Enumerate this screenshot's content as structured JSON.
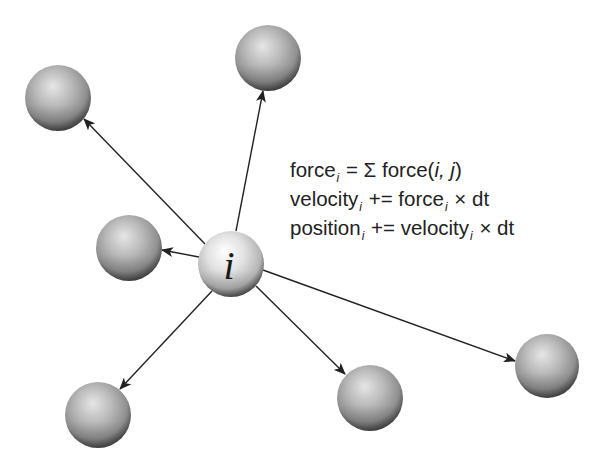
{
  "diagram": {
    "center_particle": {
      "label": "i",
      "cx": 231,
      "cy": 264,
      "r": 33
    },
    "neighbors": [
      {
        "name": "top-left",
        "cx": 58,
        "cy": 98,
        "r": 33
      },
      {
        "name": "top",
        "cx": 268,
        "cy": 58,
        "r": 33
      },
      {
        "name": "left",
        "cx": 129,
        "cy": 248,
        "r": 33
      },
      {
        "name": "bottom-left",
        "cx": 98,
        "cy": 415,
        "r": 33
      },
      {
        "name": "bottom-middle",
        "cx": 370,
        "cy": 398,
        "r": 33
      },
      {
        "name": "right",
        "cx": 547,
        "cy": 366,
        "r": 32
      }
    ],
    "colors": {
      "sphere_light": "#e4e4e4",
      "sphere_mid": "#a8a8a8",
      "sphere_dark": "#5a5a5a",
      "center_light": "#fafafa",
      "arrow": "#222222",
      "text": "#222222"
    }
  },
  "equations": {
    "line1": {
      "lhs": "force",
      "lhs_sub": "i",
      "op": " = Σ force(",
      "args": "i, j",
      "close": ")"
    },
    "line2": {
      "lhs": "velocity",
      "lhs_sub": "i",
      "op": " += force",
      "rhs_sub": "i",
      "tail": " × dt"
    },
    "line3": {
      "lhs": "position",
      "lhs_sub": "i",
      "op": " += velocity",
      "rhs_sub": "i",
      "tail": " × dt"
    }
  }
}
